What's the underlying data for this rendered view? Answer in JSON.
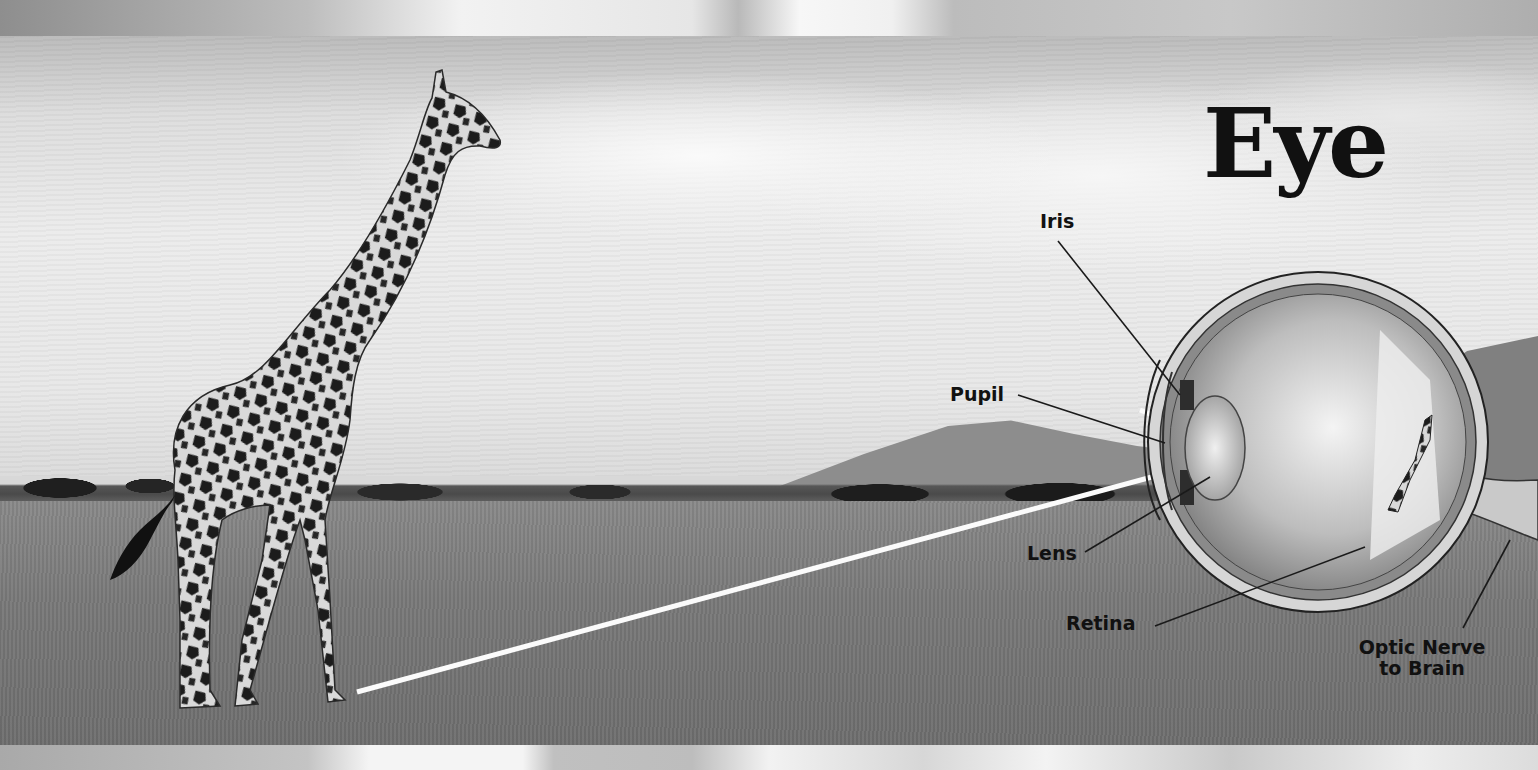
{
  "title": "Eye",
  "labels": {
    "iris": "Iris",
    "pupil": "Pupil",
    "lens": "Lens",
    "retina": "Retina",
    "optic_nerve_line1": "Optic Nerve",
    "optic_nerve_line2": "to Brain"
  },
  "illustration": {
    "subject": "giraffe",
    "scene": "savanna grassland",
    "diagram": "eye cross-section with light rays from giraffe to retina"
  },
  "colors": {
    "text": "#111111",
    "light_ray": "#ffffff",
    "leader_line": "#1a1a1a"
  }
}
